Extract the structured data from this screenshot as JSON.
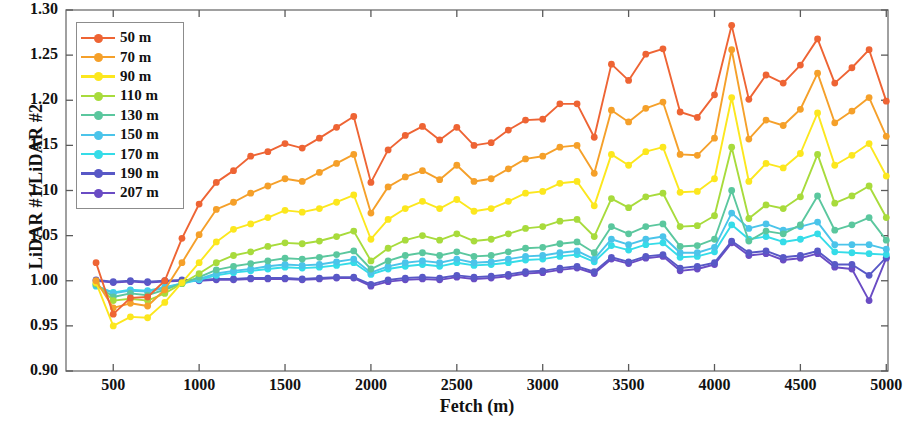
{
  "chart_data": {
    "type": "line",
    "title": "",
    "xlabel": "Fetch (m)",
    "ylabel": "LiDAR #1/LiDAR #2",
    "xlim": [
      225,
      5010
    ],
    "ylim": [
      0.9,
      1.3
    ],
    "xticks": [
      500,
      1000,
      1500,
      2000,
      2500,
      3000,
      3500,
      4000,
      4500,
      5000
    ],
    "yticks": [
      0.9,
      0.95,
      1.0,
      1.05,
      1.1,
      1.15,
      1.2,
      1.25,
      1.3
    ],
    "grid": false,
    "legend_position": "upper-left",
    "markers": "circle",
    "x": [
      400,
      500,
      600,
      700,
      800,
      900,
      1000,
      1100,
      1200,
      1300,
      1400,
      1500,
      1600,
      1700,
      1800,
      1900,
      2000,
      2100,
      2200,
      2300,
      2400,
      2500,
      2600,
      2700,
      2800,
      2900,
      3000,
      3100,
      3200,
      3300,
      3400,
      3500,
      3600,
      3700,
      3800,
      3900,
      4000,
      4100,
      4200,
      4300,
      4400,
      4500,
      4600,
      4700,
      4800,
      4900,
      5000
    ],
    "series": [
      {
        "name": "50 m",
        "label": "50 m",
        "color": "#EE6434",
        "values": [
          1.02,
          0.963,
          0.981,
          0.982,
          1.0,
          1.047,
          1.085,
          1.109,
          1.122,
          1.138,
          1.143,
          1.152,
          1.147,
          1.158,
          1.17,
          1.182,
          1.109,
          1.145,
          1.161,
          1.171,
          1.156,
          1.17,
          1.15,
          1.153,
          1.167,
          1.178,
          1.179,
          1.196,
          1.196,
          1.159,
          1.24,
          1.222,
          1.251,
          1.257,
          1.187,
          1.181,
          1.206,
          1.283,
          1.201,
          1.228,
          1.219,
          1.239,
          1.268,
          1.219,
          1.236,
          1.256,
          1.199
        ]
      },
      {
        "name": "70 m",
        "label": "70 m",
        "color": "#F5A02A",
        "values": [
          1.0,
          0.97,
          0.975,
          0.972,
          0.99,
          1.02,
          1.051,
          1.079,
          1.087,
          1.097,
          1.105,
          1.113,
          1.11,
          1.12,
          1.13,
          1.14,
          1.075,
          1.104,
          1.115,
          1.122,
          1.112,
          1.128,
          1.11,
          1.113,
          1.124,
          1.135,
          1.138,
          1.148,
          1.15,
          1.119,
          1.189,
          1.176,
          1.191,
          1.198,
          1.14,
          1.139,
          1.158,
          1.256,
          1.157,
          1.178,
          1.172,
          1.19,
          1.23,
          1.175,
          1.188,
          1.203,
          1.16
        ]
      },
      {
        "name": "90 m",
        "label": "90 m",
        "color": "#FCE71E",
        "values": [
          0.998,
          0.95,
          0.96,
          0.959,
          0.976,
          0.998,
          1.02,
          1.043,
          1.057,
          1.063,
          1.07,
          1.078,
          1.076,
          1.08,
          1.087,
          1.095,
          1.046,
          1.068,
          1.08,
          1.088,
          1.08,
          1.09,
          1.077,
          1.08,
          1.088,
          1.097,
          1.099,
          1.108,
          1.11,
          1.083,
          1.14,
          1.128,
          1.143,
          1.148,
          1.098,
          1.099,
          1.113,
          1.203,
          1.11,
          1.13,
          1.125,
          1.141,
          1.186,
          1.128,
          1.139,
          1.152,
          1.116
        ]
      },
      {
        "name": "110 m",
        "label": "110 m",
        "color": "#A8DB3C",
        "values": [
          0.997,
          0.978,
          0.98,
          0.978,
          0.986,
          0.997,
          1.008,
          1.02,
          1.028,
          1.032,
          1.038,
          1.042,
          1.041,
          1.044,
          1.049,
          1.055,
          1.022,
          1.036,
          1.045,
          1.05,
          1.045,
          1.052,
          1.044,
          1.046,
          1.052,
          1.058,
          1.06,
          1.066,
          1.068,
          1.049,
          1.091,
          1.081,
          1.093,
          1.097,
          1.06,
          1.061,
          1.072,
          1.148,
          1.069,
          1.084,
          1.08,
          1.093,
          1.14,
          1.086,
          1.094,
          1.105,
          1.07
        ]
      },
      {
        "name": "130 m",
        "label": "130 m",
        "color": "#5BC79E",
        "values": [
          0.996,
          0.982,
          0.986,
          0.984,
          0.99,
          0.997,
          1.004,
          1.012,
          1.016,
          1.019,
          1.022,
          1.025,
          1.024,
          1.026,
          1.029,
          1.033,
          1.013,
          1.022,
          1.028,
          1.031,
          1.028,
          1.032,
          1.027,
          1.028,
          1.032,
          1.036,
          1.037,
          1.041,
          1.043,
          1.031,
          1.06,
          1.052,
          1.06,
          1.063,
          1.038,
          1.039,
          1.046,
          1.1,
          1.044,
          1.055,
          1.052,
          1.062,
          1.094,
          1.056,
          1.062,
          1.07,
          1.045
        ]
      },
      {
        "name": "150 m",
        "label": "150 m",
        "color": "#4BC4EA",
        "values": [
          0.995,
          0.986,
          0.989,
          0.988,
          0.992,
          0.997,
          1.002,
          1.008,
          1.011,
          1.013,
          1.016,
          1.018,
          1.017,
          1.018,
          1.021,
          1.024,
          1.009,
          1.016,
          1.02,
          1.022,
          1.02,
          1.024,
          1.02,
          1.021,
          1.024,
          1.027,
          1.028,
          1.031,
          1.033,
          1.024,
          1.046,
          1.04,
          1.046,
          1.049,
          1.031,
          1.031,
          1.037,
          1.075,
          1.058,
          1.063,
          1.056,
          1.06,
          1.065,
          1.04,
          1.04,
          1.04,
          1.035
        ]
      },
      {
        "name": "170 m",
        "label": "170 m",
        "color": "#35DCE8",
        "values": [
          0.994,
          0.987,
          0.99,
          0.989,
          0.993,
          0.997,
          1.001,
          1.006,
          1.009,
          1.011,
          1.013,
          1.015,
          1.014,
          1.015,
          1.017,
          1.02,
          1.007,
          1.013,
          1.016,
          1.018,
          1.016,
          1.02,
          1.017,
          1.018,
          1.02,
          1.023,
          1.024,
          1.027,
          1.029,
          1.021,
          1.039,
          1.034,
          1.04,
          1.042,
          1.026,
          1.027,
          1.032,
          1.062,
          1.046,
          1.049,
          1.043,
          1.046,
          1.052,
          1.032,
          1.031,
          1.03,
          1.029
        ]
      },
      {
        "name": "190 m",
        "label": "190 m",
        "color": "#5858C6",
        "values": [
          1.001,
          0.999,
          1.0,
          0.999,
          1.0,
          1.001,
          1.001,
          1.002,
          1.002,
          1.003,
          1.003,
          1.003,
          1.002,
          1.003,
          1.004,
          1.004,
          0.996,
          1.001,
          1.003,
          1.004,
          1.003,
          1.006,
          1.004,
          1.005,
          1.007,
          1.01,
          1.011,
          1.014,
          1.016,
          1.01,
          1.026,
          1.021,
          1.027,
          1.029,
          1.014,
          1.016,
          1.02,
          1.044,
          1.031,
          1.033,
          1.026,
          1.028,
          1.033,
          1.018,
          1.018,
          1.006,
          1.026
        ]
      },
      {
        "name": "207 m",
        "label": "207 m",
        "color": "#6A4CC4",
        "values": [
          1.0,
          0.998,
          0.999,
          0.998,
          0.999,
          1.0,
          1.0,
          1.001,
          1.001,
          1.002,
          1.002,
          1.002,
          1.001,
          1.002,
          1.003,
          1.003,
          0.994,
          0.999,
          1.001,
          1.002,
          1.001,
          1.004,
          1.002,
          1.003,
          1.005,
          1.008,
          1.009,
          1.012,
          1.014,
          1.008,
          1.024,
          1.019,
          1.025,
          1.027,
          1.011,
          1.013,
          1.018,
          1.042,
          1.028,
          1.03,
          1.023,
          1.025,
          1.03,
          1.015,
          1.013,
          0.978,
          1.025
        ]
      }
    ]
  }
}
